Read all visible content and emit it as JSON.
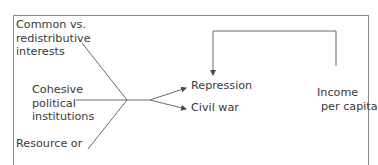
{
  "diagram": {
    "inputs": [
      {
        "id": "interests",
        "lines": [
          "Common vs.",
          "redistributive",
          "interests"
        ]
      },
      {
        "id": "institutions",
        "lines": [
          "Cohesive",
          "political",
          "institutions"
        ]
      },
      {
        "id": "resource",
        "lines": [
          "Resource or"
        ]
      }
    ],
    "outcomes": [
      {
        "id": "repression",
        "label": "Repression"
      },
      {
        "id": "civil_war",
        "label": "Civil war"
      }
    ],
    "feedback": {
      "lines": [
        "Income",
        "per capita"
      ]
    },
    "colors": {
      "line": "#6a6a6a",
      "text": "#3a3a3a",
      "frame": "#8a8a8a"
    }
  }
}
